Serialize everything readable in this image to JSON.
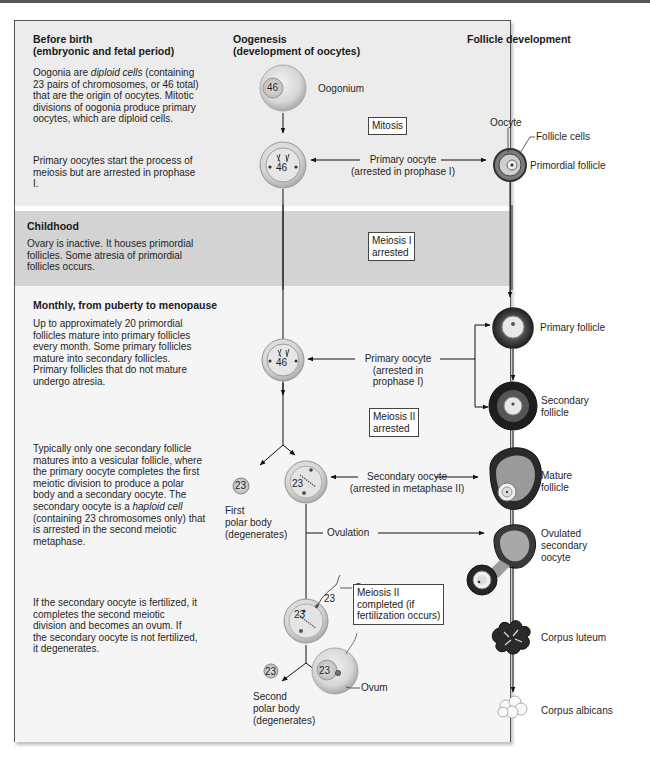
{
  "columns": {
    "stage": "",
    "oogenesis": {
      "line1": "Oogenesis",
      "line2": "(development of oocytes)"
    },
    "follicle": "Follicle development"
  },
  "stages": [
    {
      "id": "before-birth",
      "title_line1": "Before birth",
      "title_line2": "(embryonic and fetal period)",
      "para1_a": "Oogonia are ",
      "para1_italic": "diploid cells",
      "para1_b": "(containing 23 pairs of chromosomes, or 46 total) that are the origin of oocytes. Mitotic divisions of oogonia produce primary oocytes, which are diploid cells.",
      "para2": "Primary oocytes start the process of meiosis but are arrested in prophase I."
    },
    {
      "id": "childhood",
      "title": "Childhood",
      "para1": "Ovary is inactive. It houses primordial follicles. Some atresia of primordial follicles occurs."
    },
    {
      "id": "monthly",
      "title": "Monthly, from puberty to menopause",
      "para1": "Up to approximately 20 primordial follicles mature into primary follicles every month. Some primary follicles mature into secondary follicles. Primary follicles that do not mature undergo atresia.",
      "para2_a": "Typically only one secondary follicle matures into a vesicular follicle, where the primary oocyte completes the first meiotic division to produce a polar body and a secondary oocyte. The secondary oocyte is a ",
      "para2_italic": "haploid cell",
      "para2_b": " (containing 23 chromosomes only) that is arrested in the second meiotic metaphase.",
      "para3": "If the secondary oocyte is fertilized, it completes the second meiotic division and becomes an ovum. If the secondary oocyte is not fertilized, it degenerates."
    }
  ],
  "cells": {
    "oogonium": {
      "label": "Oogonium",
      "chromosomes": "46"
    },
    "primary_oocyte_1": {
      "chromosomes": "46"
    },
    "primary_oocyte_2": {
      "chromosomes": "46"
    },
    "secondary_oocyte": {
      "chromosomes": "23"
    },
    "first_polar_body": {
      "chromosomes": "23",
      "label_l1": "First",
      "label_l2": "polar body",
      "label_l3": "(degenerates)"
    },
    "fertilized_oocyte": {
      "chromosomes": "23",
      "sperm_chromosomes": "23"
    },
    "second_polar_body": {
      "chromosomes": "23",
      "label_l1": "Second",
      "label_l2": "polar body",
      "label_l3": "(degenerates)"
    },
    "ovum": {
      "chromosomes": "23",
      "label": "Ovum"
    }
  },
  "process_boxes": {
    "mitosis": "Mitosis",
    "meiosis1_arrested_l1": "Meiosis I",
    "meiosis1_arrested_l2": "arrested",
    "meiosis2_arrested_l1": "Meiosis II",
    "meiosis2_arrested_l2": "arrested",
    "meiosis2_completed_l1": "Meiosis II",
    "meiosis2_completed_l2": "completed (if",
    "meiosis2_completed_l3": "fertilization occurs)"
  },
  "connector_labels": {
    "primary_oocyte_1_l1": "Primary oocyte",
    "primary_oocyte_1_l2": "(arrested in prophase I)",
    "primary_oocyte_2_l1": "Primary oocyte",
    "primary_oocyte_2_l2": "(arrested in",
    "primary_oocyte_2_l3": "prophase I)",
    "secondary_oocyte_l1": "Secondary oocyte",
    "secondary_oocyte_l2": "(arrested in metaphase II)",
    "ovulation": "Ovulation",
    "sperm": "Sperm"
  },
  "follicles": {
    "oocyte": "Oocyte",
    "follicle_cells": "Follicle cells",
    "primordial": "Primordial follicle",
    "primary": "Primary follicle",
    "secondary_l1": "Secondary",
    "secondary_l2": "follicle",
    "mature_l1": "Mature",
    "mature_l2": "follicle",
    "ovulated_l1": "Ovulated",
    "ovulated_l2": "secondary",
    "ovulated_l3": "oocyte",
    "corpus_luteum": "Corpus luteum",
    "corpus_albicans": "Corpus albicans"
  },
  "colors": {
    "band_before": "#ececec",
    "band_childhood": "#d3d3d3",
    "band_monthly": "#f5f5f5",
    "cell_fill": "#d9d9d9",
    "follicle_dark": "#2a2a2a"
  }
}
